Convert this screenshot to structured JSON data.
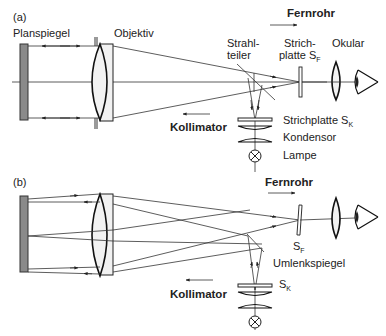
{
  "panels": [
    {
      "id": "a",
      "label": "(a)",
      "components": {
        "mirror": "Planspiegel",
        "objective": "Objektiv",
        "beamsplitter": "Strahl-\nteiler",
        "beamsplitter_line1": "Strahl-",
        "beamsplitter_line2": "teiler",
        "reticle_f_line1": "Strich-",
        "reticle_f_line2": "platte S",
        "reticle_f_sub": "F",
        "eyepiece": "Okular",
        "reticle_k": "Strichplatte S",
        "reticle_k_sub": "K",
        "condenser": "Kondensor",
        "lamp": "Lampe"
      },
      "paths": {
        "telescope": "Fernrohr",
        "collimator": "Kollimator"
      }
    },
    {
      "id": "b",
      "label": "(b)",
      "components": {
        "reticle_f": "S",
        "reticle_f_sub": "F",
        "deflection_mirror": "Umlenkspiegel",
        "reticle_k": "S",
        "reticle_k_sub": "K"
      },
      "paths": {
        "telescope": "Fernrohr",
        "collimator": "Kollimator"
      }
    }
  ],
  "colors": {
    "mirror_fill": "#8a8a8a",
    "stop_fill": "#9a9a9a",
    "line": "#222222",
    "lens_fill": "#f2f2f2"
  }
}
